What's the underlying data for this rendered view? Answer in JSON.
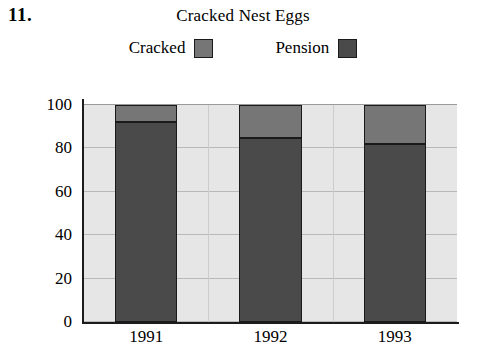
{
  "problem_number": "11.",
  "chart_data": {
    "type": "bar",
    "subtype": "stacked-percent",
    "title": "Cracked Nest Eggs",
    "xlabel": "",
    "ylabel": "",
    "categories": [
      "1991",
      "1992",
      "1993"
    ],
    "series": [
      {
        "name": "Pension",
        "color": "#4a4a4a",
        "values": [
          92,
          85,
          82
        ]
      },
      {
        "name": "Cracked",
        "color": "#767676",
        "values": [
          8,
          15,
          18
        ]
      }
    ],
    "stack_tops": [
      100,
      100,
      100
    ],
    "divider_values": [
      92,
      85,
      82
    ],
    "ylim": [
      0,
      100
    ],
    "yticks": [
      0,
      20,
      40,
      60,
      80,
      100
    ],
    "ytick_labels": [
      "0",
      "20",
      "40",
      "60",
      "80",
      "100"
    ],
    "grid": true,
    "legend_position": "top",
    "legend": [
      {
        "label": "Cracked",
        "swatch": "cracked",
        "color": "#767676"
      },
      {
        "label": "Pension",
        "swatch": "pension",
        "color": "#4a4a4a"
      }
    ],
    "plot_background": "#e6e6e6",
    "axis_color": "#1c1c1c",
    "gridline_color": "#b9b9b9"
  }
}
